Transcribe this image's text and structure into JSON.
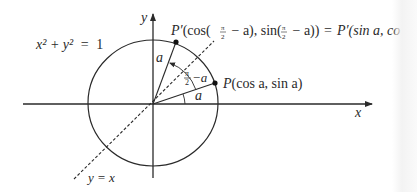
{
  "figure": {
    "circle_equation": {
      "lhs": "x² + y²",
      "eq": "=",
      "rhs": "1"
    },
    "axes": {
      "x_label": "x",
      "y_label": "y"
    },
    "line_label": "y = x",
    "point_P": {
      "name": "P",
      "coords": "(cos a, sin a)"
    },
    "point_P_prime": {
      "name": "P′",
      "left_part": "(cos(",
      "pi_over_2_a": "π",
      "pi_over_2_b": "2",
      "mid1": " − a), sin(",
      "mid2": " − a))",
      "equals": "=",
      "right_part": "P′(sin a, co"
    },
    "angle_labels": {
      "alpha_upper": "a",
      "alpha_lower": "a",
      "complement_num": "π",
      "complement_den": "2",
      "complement_rest": "−a"
    },
    "colors": {
      "ink": "#2a2a2a",
      "background": "#ffffff"
    }
  }
}
